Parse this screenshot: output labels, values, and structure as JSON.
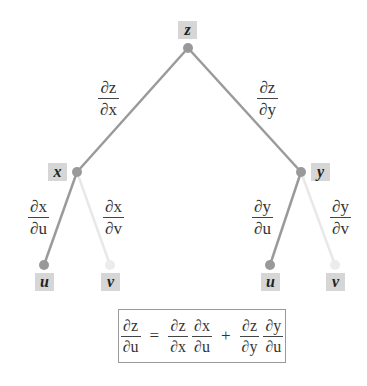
{
  "diagram": {
    "type": "tree",
    "colors": {
      "edge_main": "#999999",
      "edge_faint": "#e6e6e6",
      "node_box": "#d6d6d6",
      "text": "#333333"
    },
    "nodes": {
      "root": {
        "label": "z"
      },
      "left": {
        "label": "x"
      },
      "right": {
        "label": "y"
      },
      "left_u": {
        "label": "u"
      },
      "left_v": {
        "label": "v"
      },
      "right_u": {
        "label": "u"
      },
      "right_v": {
        "label": "v"
      }
    },
    "edges": {
      "z_x": {
        "num": "∂z",
        "den": "∂x"
      },
      "z_y": {
        "num": "∂z",
        "den": "∂y"
      },
      "x_u": {
        "num": "∂x",
        "den": "∂u"
      },
      "x_v": {
        "num": "∂x",
        "den": "∂v"
      },
      "y_u": {
        "num": "∂y",
        "den": "∂u"
      },
      "y_v": {
        "num": "∂y",
        "den": "∂v"
      }
    },
    "formula": {
      "lhs": {
        "num": "∂z",
        "den": "∂u"
      },
      "equals": "=",
      "term1": [
        {
          "num": "∂z",
          "den": "∂x"
        },
        {
          "num": "∂x",
          "den": "∂u"
        }
      ],
      "plus": "+",
      "term2": [
        {
          "num": "∂z",
          "den": "∂y"
        },
        {
          "num": "∂y",
          "den": "∂u"
        }
      ]
    }
  }
}
